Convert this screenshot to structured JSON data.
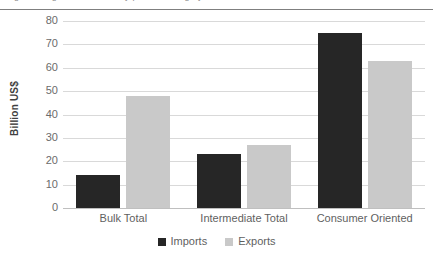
{
  "top_partial_text": "Figure 3. Agricultural trade by product category",
  "chart_data": {
    "type": "bar",
    "title": "",
    "xlabel": "",
    "ylabel": "Billion US$",
    "categories": [
      "Bulk Total",
      "Intermediate Total",
      "Consumer Oriented"
    ],
    "series": [
      {
        "name": "Imports",
        "values": [
          14,
          23,
          75
        ],
        "color": "#262626"
      },
      {
        "name": "Exports",
        "values": [
          48,
          27,
          63
        ],
        "color": "#c9c9c9"
      }
    ],
    "ylim": [
      0,
      80
    ],
    "ytick_step": 10,
    "yticks": [
      80,
      70,
      60,
      50,
      40,
      30,
      20,
      10,
      0
    ],
    "grid": true,
    "legend_position": "bottom",
    "legend_entries": [
      "Imports",
      "Exports"
    ]
  },
  "axis": {
    "y_title": "Billion US$"
  },
  "legend": {
    "items": [
      {
        "label": "Imports"
      },
      {
        "label": "Exports"
      }
    ]
  }
}
